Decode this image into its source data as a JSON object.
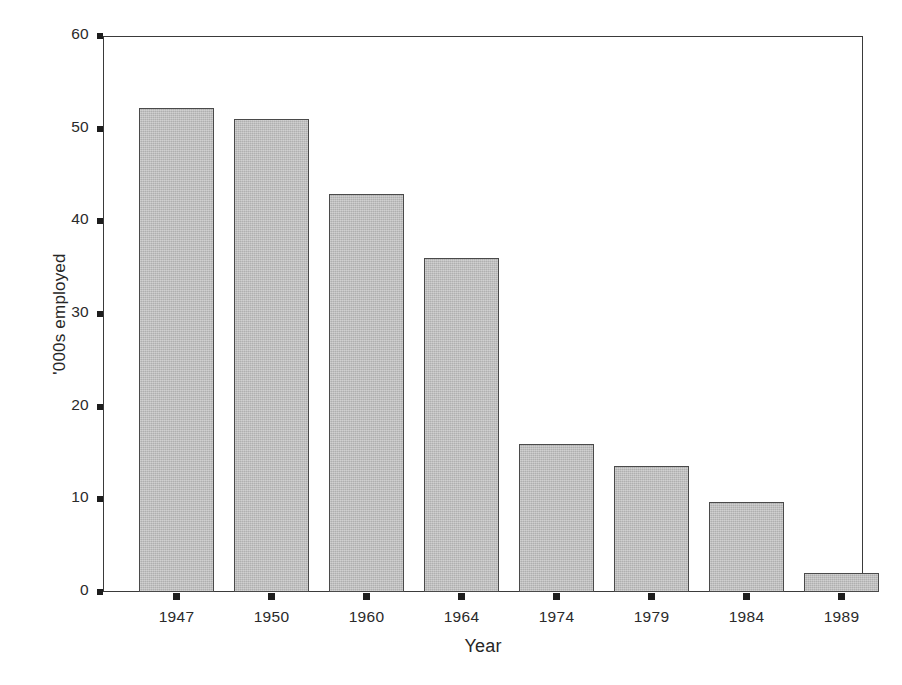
{
  "chart_data": {
    "type": "bar",
    "title": "",
    "xlabel": "Year",
    "ylabel": "'000s employed",
    "categories": [
      "1947",
      "1950",
      "1960",
      "1964",
      "1974",
      "1979",
      "1984",
      "1989"
    ],
    "values": [
      52.2,
      51.0,
      43.0,
      36.0,
      16.0,
      13.6,
      9.7,
      2.1
    ],
    "series": [
      {
        "name": "'000s employed",
        "values": [
          52.2,
          51.0,
          43.0,
          36.0,
          16.0,
          13.6,
          9.7,
          2.1
        ]
      }
    ],
    "ylim": [
      0,
      60
    ],
    "ytick_labels": [
      "0",
      "10",
      "20",
      "30",
      "40",
      "50",
      "60"
    ],
    "ytick_values": [
      0,
      10,
      20,
      30,
      40,
      50,
      60
    ],
    "xtick_labels": [
      "1947",
      "1950",
      "1960",
      "1964",
      "1974",
      "1979",
      "1984",
      "1989"
    ],
    "grid": false,
    "legend": false,
    "legend_position": "none",
    "annotations": [],
    "colors": {
      "bar_fill": "#b6b6b6",
      "bar_edge": "#4a4a4a",
      "axis": "#3a3a3a",
      "text": "#262626",
      "background": "#ffffff"
    }
  }
}
